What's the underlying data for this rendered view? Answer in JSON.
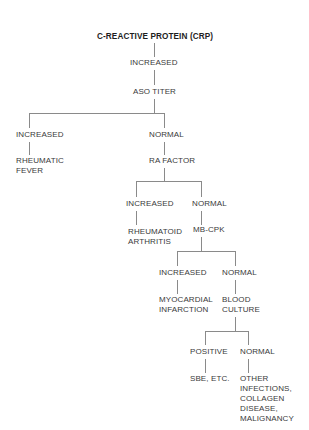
{
  "diagram": {
    "type": "decision-tree",
    "root": {
      "label": "C-REACTIVE PROTEIN (CRP)"
    },
    "nodes": {
      "crp_increased": "INCREASED",
      "aso_titer": "ASO TITER",
      "aso_increased": "INCREASED",
      "aso_normal": "NORMAL",
      "rheumatic_fever": [
        "RHEUMATIC",
        "FEVER"
      ],
      "ra_factor": "RA FACTOR",
      "ra_increased": "INCREASED",
      "ra_normal": "NORMAL",
      "rheumatoid_arthritis": [
        "RHEUMATOID",
        "ARTHRITIS"
      ],
      "mb_cpk": "MB-CPK",
      "mb_increased": "INCREASED",
      "mb_normal": "NORMAL",
      "myocardial_infarction": [
        "MYOCARDIAL",
        "INFARCTION"
      ],
      "blood_culture": [
        "BLOOD",
        "CULTURE"
      ],
      "bc_positive": "POSITIVE",
      "bc_normal": "NORMAL",
      "sbe_etc": "SBE, ETC.",
      "other_dx": [
        "OTHER",
        "INFECTIONS,",
        "COLLAGEN",
        "DISEASE,",
        "MALIGNANCY"
      ]
    },
    "edges": [
      [
        "root",
        "crp_increased"
      ],
      [
        "crp_increased",
        "aso_titer"
      ],
      [
        "aso_titer",
        "aso_increased"
      ],
      [
        "aso_titer",
        "aso_normal"
      ],
      [
        "aso_increased",
        "rheumatic_fever"
      ],
      [
        "aso_normal",
        "ra_factor"
      ],
      [
        "ra_factor",
        "ra_increased"
      ],
      [
        "ra_factor",
        "ra_normal"
      ],
      [
        "ra_increased",
        "rheumatoid_arthritis"
      ],
      [
        "ra_normal",
        "mb_cpk"
      ],
      [
        "mb_cpk",
        "mb_increased"
      ],
      [
        "mb_cpk",
        "mb_normal"
      ],
      [
        "mb_increased",
        "myocardial_infarction"
      ],
      [
        "mb_normal",
        "blood_culture"
      ],
      [
        "blood_culture",
        "bc_positive"
      ],
      [
        "blood_culture",
        "bc_normal"
      ],
      [
        "bc_positive",
        "sbe_etc"
      ],
      [
        "bc_normal",
        "other_dx"
      ]
    ]
  }
}
